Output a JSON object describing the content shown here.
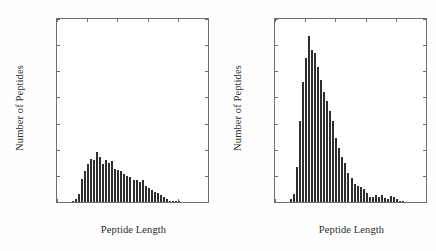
{
  "figure": {
    "background_color": "#fefefe",
    "bar_color": "#2e2e2e",
    "axis_color": "#6e6e6e",
    "text_color": "#2b2b2b"
  },
  "chart_data": [
    {
      "type": "bar",
      "panel": "left",
      "title": "",
      "xlabel": "Peptide Length",
      "ylabel": "Number of Peptides",
      "xlim": [
        0,
        50
      ],
      "ylim": [
        0,
        1400
      ],
      "xticks": [
        0,
        10,
        20,
        30,
        40,
        50
      ],
      "yticks": [
        0,
        200,
        400,
        600,
        800,
        1000,
        1200,
        1400
      ],
      "xtick_labels": [
        "0",
        "10",
        "20",
        "30",
        "40",
        "50"
      ],
      "ytick_labels": [
        "0",
        "200",
        "400",
        "600",
        "800",
        "1000",
        "1200",
        "1400"
      ],
      "grid": false,
      "legend": false,
      "bin_width": 1,
      "x": [
        5,
        6,
        7,
        8,
        9,
        10,
        11,
        12,
        13,
        14,
        15,
        16,
        17,
        18,
        19,
        20,
        21,
        22,
        23,
        24,
        25,
        26,
        27,
        28,
        29,
        30,
        31,
        32,
        33,
        34,
        35,
        36,
        37,
        38,
        39,
        40
      ],
      "values": [
        8,
        20,
        60,
        175,
        235,
        290,
        330,
        320,
        380,
        345,
        290,
        320,
        300,
        315,
        255,
        245,
        240,
        215,
        200,
        190,
        165,
        165,
        150,
        170,
        120,
        110,
        90,
        80,
        70,
        55,
        35,
        20,
        6,
        4,
        2,
        8
      ]
    },
    {
      "type": "bar",
      "panel": "right",
      "title": "",
      "xlabel": "Peptide Length",
      "ylabel": "Number of Peptides",
      "xlim": [
        0,
        50
      ],
      "ylim": [
        0,
        1400
      ],
      "xticks": [
        0,
        10,
        20,
        30,
        40,
        50
      ],
      "yticks": [
        0,
        200,
        400,
        600,
        800,
        1000,
        1200,
        1400
      ],
      "xtick_labels": [
        "0",
        "10",
        "20",
        "30",
        "40",
        "50"
      ],
      "ytick_labels": [
        "0",
        "200",
        "400",
        "600",
        "800",
        "1000",
        "1200",
        "1400"
      ],
      "grid": false,
      "legend": false,
      "bin_width": 1,
      "x": [
        5,
        6,
        7,
        8,
        9,
        10,
        11,
        12,
        13,
        14,
        15,
        16,
        17,
        18,
        19,
        20,
        21,
        22,
        23,
        24,
        25,
        26,
        27,
        28,
        29,
        30,
        31,
        32,
        33,
        34,
        35,
        36,
        37,
        38,
        39,
        40,
        41,
        42
      ],
      "values": [
        20,
        65,
        265,
        620,
        920,
        1105,
        1270,
        1160,
        1140,
        1035,
        930,
        845,
        775,
        700,
        620,
        490,
        410,
        345,
        300,
        225,
        185,
        140,
        125,
        115,
        100,
        70,
        40,
        35,
        55,
        35,
        50,
        30,
        20,
        45,
        40,
        25,
        5,
        2
      ]
    }
  ]
}
